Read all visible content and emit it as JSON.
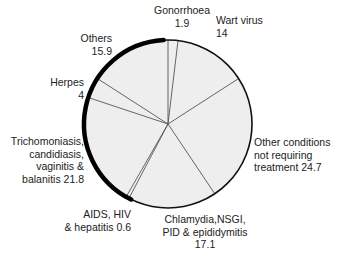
{
  "chart_data": {
    "type": "pie",
    "title": "",
    "start_angle_deg": 0,
    "direction": "clockwise",
    "categories": [
      "Gonorrhoea",
      "Wart virus",
      "Other conditions not requiring treatment",
      "Chlamydia,NSGI, PID & epididymitis",
      "AIDS, HIV & hepatitis",
      "Trichomoniasis, candidiasis, vaginitis & balanitis",
      "Herpes",
      "Others"
    ],
    "values": [
      1.9,
      14,
      24.7,
      17.1,
      0.6,
      21.8,
      4,
      15.9
    ],
    "colors": {
      "fill": "#eeeeee",
      "divider": "#555555",
      "outline": "#111111"
    },
    "legend": "none (direct labels)"
  },
  "labels": {
    "gonorrhoea": {
      "line1": "Gonorrhoea",
      "line2": "1.9"
    },
    "wart": {
      "line1": "Wart virus",
      "line2": "14"
    },
    "other_conditions": {
      "line1": "Other conditions",
      "line2": "not requiring",
      "line3": "treatment 24.7"
    },
    "chlamydia": {
      "line1": "Chlamydia,NSGI,",
      "line2": "PID & epididymitis",
      "line3": "17.1"
    },
    "aids": {
      "line1": "AIDS, HIV",
      "line2": "& hepatitis 0.6"
    },
    "trichomoniasis": {
      "line1": "Trichomoniasis,",
      "line2": "candidiasis,",
      "line3": "vaginitis &",
      "line4": "balanitis 21.8"
    },
    "herpes": {
      "line1": "Herpes",
      "line2": "4"
    },
    "others": {
      "line1": "Others",
      "line2": "15.9"
    }
  }
}
